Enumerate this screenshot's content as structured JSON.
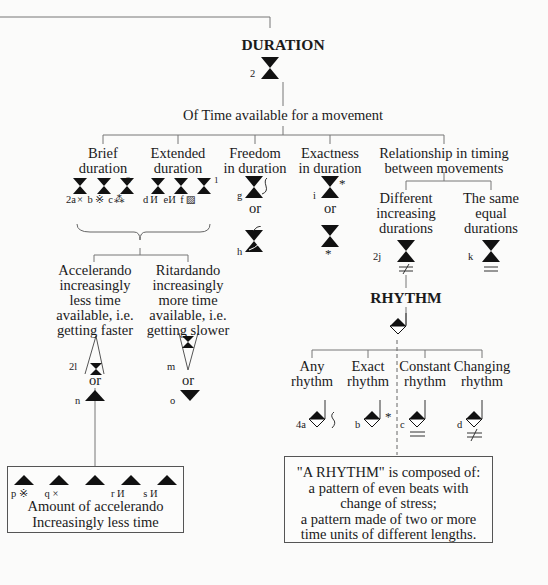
{
  "diagram": {
    "root": {
      "title": "DURATION",
      "symbol_label": "2"
    },
    "level1": {
      "label": "Of Time available for a movement"
    },
    "categories": [
      {
        "id": "brief",
        "label_line1": "Brief",
        "label_line2": "duration",
        "superscript": "2",
        "symbols": [
          {
            "letter": "2a",
            "mark": "×"
          },
          {
            "letter": "b",
            "mark": "※"
          },
          {
            "letter": "c",
            "mark": "⁂"
          }
        ]
      },
      {
        "id": "extended",
        "label_line1": "Extended",
        "label_line2": "duration",
        "superscript": "1",
        "symbols": [
          {
            "letter": "d",
            "mark": "И"
          },
          {
            "letter": "e",
            "mark": "И"
          },
          {
            "letter": "f",
            "mark": "▨"
          }
        ]
      },
      {
        "id": "freedom",
        "label_line1": "Freedom",
        "label_line2": "in duration",
        "symbols": [
          {
            "letter": "g"
          },
          {
            "letter": "h"
          }
        ],
        "or": "or"
      },
      {
        "id": "exactness",
        "label_line1": "Exactness",
        "label_line2": "in duration",
        "symbols": [
          {
            "letter": "i",
            "mark": "*"
          },
          {
            "letter": "",
            "mark": "*"
          }
        ],
        "or": "or"
      },
      {
        "id": "relationship",
        "label_line1": "Relationship in timing",
        "label_line2": "between movements"
      }
    ],
    "relationship_children": [
      {
        "id": "different",
        "lines": [
          "Different",
          "increasing",
          "durations"
        ],
        "letter": "2j",
        "mark": "≠"
      },
      {
        "id": "same",
        "lines": [
          "The same",
          "equal",
          "durations"
        ],
        "letter": "k",
        "mark": "="
      }
    ],
    "tempo": [
      {
        "id": "accelerando",
        "lines": [
          "Accelerando",
          "increasingly",
          "less time",
          "available, i.e.",
          "getting faster"
        ],
        "letter_top": "2l",
        "or": "or",
        "letter_bottom": "n"
      },
      {
        "id": "ritardando",
        "lines": [
          "Ritardando",
          "increasingly",
          "more time",
          "available, i.e.",
          "getting slower"
        ],
        "letter_top": "m",
        "or": "or",
        "letter_bottom": "o"
      }
    ],
    "accelerando_box": {
      "symbols": [
        {
          "letter": "p",
          "mark": "※"
        },
        {
          "letter": "q",
          "mark": "×"
        },
        {
          "letter": "",
          "mark": ""
        },
        {
          "letter": "r",
          "mark": "И"
        },
        {
          "letter": "s",
          "mark": "И"
        }
      ],
      "line1": "Amount of accelerando",
      "line2": "Increasingly less time"
    },
    "rhythm": {
      "title": "RHYTHM",
      "children": [
        {
          "id": "any",
          "line1": "Any",
          "line2": "rhythm",
          "letter": "4a",
          "mark": "~"
        },
        {
          "id": "exact",
          "line1": "Exact",
          "line2": "rhythm",
          "letter": "b",
          "mark": "*"
        },
        {
          "id": "constant",
          "line1": "Constant",
          "line2": "rhythm",
          "letter": "c",
          "mark": "="
        },
        {
          "id": "changing",
          "line1": "Changing",
          "line2": "rhythm",
          "letter": "d",
          "mark": "≠"
        }
      ],
      "definition_box": {
        "line1": "\"A RHYTHM\" is composed of:",
        "line2": "a pattern of even beats with",
        "line3": "change of stress;",
        "line4": "a pattern made of two or more",
        "line5": "time units of different lengths."
      }
    }
  }
}
